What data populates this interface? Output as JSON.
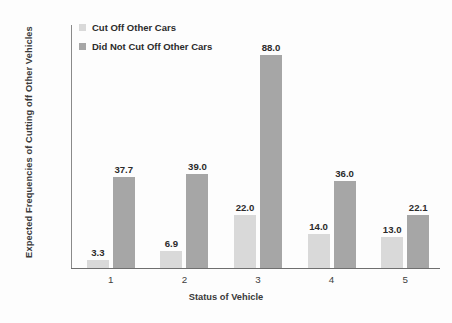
{
  "chart_data": {
    "type": "bar",
    "title": "",
    "subtitle": "",
    "xlabel": "Status of Vehicle",
    "ylabel": "Expected Frequencies of Cutting off Other Vehicles",
    "categories": [
      "1",
      "2",
      "3",
      "4",
      "5"
    ],
    "series": [
      {
        "name": "Cut Off Other Cars",
        "color": "#D9D9D9",
        "values": [
          3.3,
          6.9,
          22.0,
          14.0,
          13.0
        ],
        "labels": [
          "3.3",
          "6.9",
          "22.0",
          "14.0",
          "13.0"
        ]
      },
      {
        "name": "Did Not Cut Off Other Cars",
        "color": "#A6A6A6",
        "values": [
          37.7,
          39.0,
          88.0,
          36.0,
          22.1
        ],
        "labels": [
          "37.7",
          "39.0",
          "88.0",
          "36.0",
          "22.1"
        ]
      }
    ],
    "ylim": [
      0.0,
      100.0
    ],
    "ytick_step": 10.0,
    "yticks": [
      "0.0",
      "10.0",
      "20.0",
      "30.0",
      "40.0",
      "50.0",
      "60.0",
      "70.0",
      "80.0",
      "90.0",
      "100.0"
    ],
    "grid": false,
    "legend_position": "top-left",
    "background_color": "#FFFFFF",
    "axis_color": "#808080"
  }
}
